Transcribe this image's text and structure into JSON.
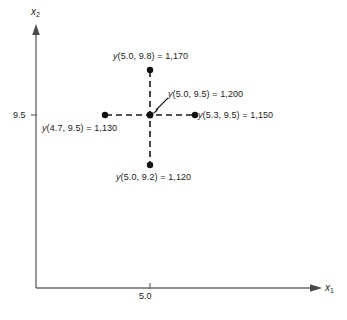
{
  "chart_data": {
    "type": "scatter",
    "title": "",
    "xlabel": "x1",
    "ylabel": "x2",
    "grid": false,
    "legend": "none",
    "xlim": [
      4.4,
      5.9
    ],
    "ylim": [
      8.6,
      10.3
    ],
    "axis_labels": {
      "x": "x",
      "x_sub": "1",
      "y": "x",
      "y_sub": "2"
    },
    "ticks": {
      "x": [
        "5.0"
      ],
      "y": [
        "9.5"
      ]
    },
    "points": [
      {
        "name": "center",
        "x": 5.0,
        "y2": 9.5,
        "value": "1,200",
        "label": "y(5.0, 9.5) = 1,200"
      },
      {
        "name": "up",
        "x": 5.0,
        "y2": 9.8,
        "value": "1,170",
        "label": "y(5.0, 9.8) = 1,170"
      },
      {
        "name": "down",
        "x": 5.0,
        "y2": 9.2,
        "value": "1,120",
        "label": "y(5.0, 9.2) = 1,120"
      },
      {
        "name": "left",
        "x": 4.7,
        "y2": 9.5,
        "value": "1,130",
        "label": "y(4.7, 9.5) = 1,130"
      },
      {
        "name": "right",
        "x": 5.3,
        "y2": 9.5,
        "value": "1,150",
        "label": "y(5.3, 9.5) = 1,150"
      }
    ],
    "annotations": [
      {
        "name": "center-callout",
        "text": "y(5.0, 9.5) = 1,200",
        "points_to": "center"
      }
    ],
    "colors": {
      "axis": "#6b6b6b",
      "marker": "#111111",
      "dashed_line": "#1a1a1a",
      "text": "#222222",
      "background": "#ffffff"
    }
  },
  "labels": {
    "top": "y(5.0, 9.8) = 1,170",
    "center": "y(5.0, 9.5) = 1,200",
    "right": "y(5.3, 9.5) = 1,150",
    "left": "y(4.7, 9.5) = 1,130",
    "bottom": "y(5.0, 9.2) = 1,120",
    "tick_y": "9.5",
    "tick_x": "5.0"
  }
}
